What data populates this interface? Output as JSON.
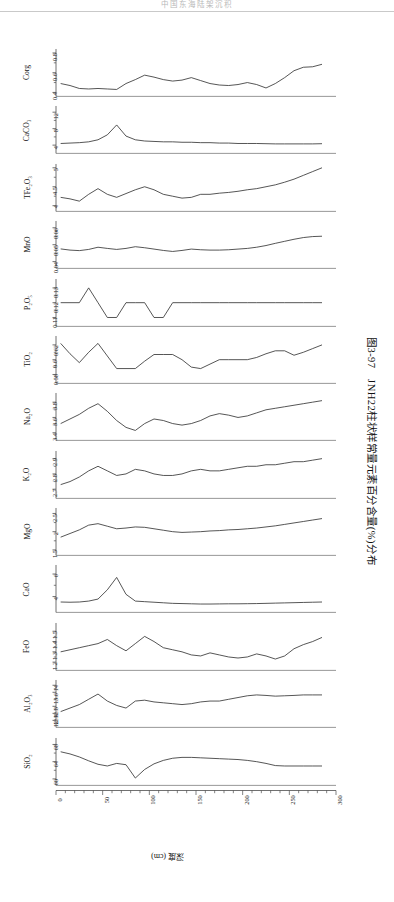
{
  "running_head": "中国东海陆架沉积",
  "figure": {
    "caption_number": "图3-97",
    "caption_text": "JNH22柱状样常量元素百分含量(%)分布",
    "caption_full": "图3-97　JNH22柱状样常量元素百分含量(%)分布",
    "x_axis": {
      "title": "深度 (cm)",
      "ticks": [
        0,
        50,
        100,
        150,
        200,
        250,
        300
      ],
      "minor_step": 10,
      "range": [
        0,
        300
      ]
    },
    "line_color": "#2b2b2b",
    "axis_color": "#4d4d4d"
  },
  "chart_data": {
    "type": "line",
    "title": "JNH22柱状样常量元素百分含量(%)分布",
    "xlabel": "深度 (cm)",
    "ylabel": "",
    "shared_x": [
      5,
      15,
      25,
      35,
      45,
      55,
      65,
      75,
      85,
      95,
      105,
      115,
      125,
      135,
      145,
      155,
      165,
      175,
      185,
      195,
      205,
      215,
      225,
      235,
      245,
      255,
      265,
      275,
      285
    ],
    "xlim": [
      0,
      300
    ],
    "grid": false,
    "legend": "none",
    "panels": [
      {
        "name": "Corg",
        "label": "Corg",
        "ticks": [
          0.4,
          0.6,
          0.8
        ],
        "ylim": [
          0.36,
          0.84
        ],
        "values": [
          0.49,
          0.47,
          0.44,
          0.435,
          0.44,
          0.435,
          0.43,
          0.49,
          0.53,
          0.575,
          0.555,
          0.53,
          0.515,
          0.525,
          0.55,
          0.52,
          0.49,
          0.475,
          0.47,
          0.48,
          0.5,
          0.48,
          0.445,
          0.49,
          0.55,
          0.62,
          0.655,
          0.66,
          0.685
        ]
      },
      {
        "name": "CaCO3",
        "label": "CaCO₃",
        "ticks": [
          4,
          8,
          12
        ],
        "ylim": [
          2.0,
          13.5
        ],
        "values": [
          4.4,
          4.5,
          4.6,
          4.8,
          5.3,
          6.5,
          8.9,
          6.2,
          5.3,
          5.0,
          4.9,
          4.8,
          4.8,
          4.7,
          4.7,
          4.6,
          4.6,
          4.5,
          4.5,
          4.4,
          4.4,
          4.4,
          4.35,
          4.3,
          4.3,
          4.3,
          4.3,
          4.3,
          4.35
        ]
      },
      {
        "name": "TFe2O3",
        "label": "TFe₂O₃",
        "ticks": [
          4.0,
          4.5,
          5.0
        ],
        "ylim": [
          3.85,
          5.1
        ],
        "values": [
          4.22,
          4.18,
          4.12,
          4.3,
          4.45,
          4.3,
          4.22,
          4.32,
          4.42,
          4.5,
          4.42,
          4.3,
          4.25,
          4.2,
          4.22,
          4.3,
          4.3,
          4.33,
          4.35,
          4.38,
          4.42,
          4.45,
          4.5,
          4.55,
          4.62,
          4.7,
          4.8,
          4.9,
          5.0
        ]
      },
      {
        "name": "MnO",
        "label": "MnO",
        "ticks": [
          0.04,
          0.05,
          0.06
        ],
        "ylim": [
          0.036,
          0.064
        ],
        "values": [
          0.0475,
          0.0468,
          0.0465,
          0.0472,
          0.0485,
          0.0478,
          0.0472,
          0.0478,
          0.0488,
          0.0482,
          0.0474,
          0.0466,
          0.046,
          0.0466,
          0.0474,
          0.047,
          0.0468,
          0.0468,
          0.047,
          0.0474,
          0.0478,
          0.0485,
          0.0495,
          0.0508,
          0.052,
          0.0532,
          0.0542,
          0.0548,
          0.055
        ]
      },
      {
        "name": "P2O5",
        "label": "P₂O₅",
        "ticks": [
          0.11,
          0.12,
          0.13
        ],
        "ylim": [
          0.104,
          0.136
        ],
        "values": [
          0.12,
          0.12,
          0.12,
          0.13,
          0.12,
          0.11,
          0.11,
          0.12,
          0.12,
          0.12,
          0.11,
          0.11,
          0.12,
          0.12,
          0.12,
          0.12,
          0.12,
          0.12,
          0.12,
          0.12,
          0.12,
          0.12,
          0.12,
          0.12,
          0.12,
          0.12,
          0.12,
          0.12,
          0.12
        ]
      },
      {
        "name": "TiO2",
        "label": "TiO₂",
        "ticks": [
          0.58,
          0.6,
          0.62
        ],
        "ylim": [
          0.568,
          0.632
        ],
        "values": [
          0.622,
          0.608,
          0.596,
          0.61,
          0.622,
          0.605,
          0.588,
          0.588,
          0.588,
          0.598,
          0.607,
          0.607,
          0.607,
          0.6,
          0.59,
          0.588,
          0.594,
          0.6,
          0.6,
          0.6,
          0.6,
          0.603,
          0.608,
          0.612,
          0.612,
          0.606,
          0.61,
          0.615,
          0.62
        ]
      },
      {
        "name": "Na2O",
        "label": "Na₂O",
        "ticks": [
          3.4,
          3.6,
          3.8
        ],
        "ylim": [
          3.3,
          3.92
        ],
        "values": [
          3.52,
          3.58,
          3.64,
          3.72,
          3.78,
          3.68,
          3.56,
          3.47,
          3.43,
          3.52,
          3.58,
          3.56,
          3.52,
          3.5,
          3.52,
          3.56,
          3.62,
          3.65,
          3.63,
          3.6,
          3.62,
          3.66,
          3.7,
          3.72,
          3.74,
          3.76,
          3.78,
          3.8,
          3.82
        ]
      },
      {
        "name": "K2O",
        "label": "K₂O",
        "ticks": [
          2.7,
          2.8,
          2.9
        ],
        "ylim": [
          2.64,
          2.95
        ],
        "values": [
          2.73,
          2.75,
          2.78,
          2.82,
          2.85,
          2.82,
          2.79,
          2.8,
          2.83,
          2.82,
          2.8,
          2.79,
          2.79,
          2.8,
          2.82,
          2.83,
          2.82,
          2.82,
          2.83,
          2.84,
          2.85,
          2.85,
          2.86,
          2.86,
          2.87,
          2.88,
          2.88,
          2.89,
          2.9
        ]
      },
      {
        "name": "MgO",
        "label": "MgO",
        "ticks": [
          1.5,
          2.0,
          2.5
        ],
        "ylim": [
          1.35,
          2.65
        ],
        "values": [
          1.85,
          1.95,
          2.05,
          2.18,
          2.22,
          2.15,
          2.08,
          2.1,
          2.13,
          2.12,
          2.08,
          2.04,
          2.0,
          1.98,
          1.99,
          2.0,
          2.02,
          2.03,
          2.05,
          2.06,
          2.08,
          2.1,
          2.13,
          2.16,
          2.2,
          2.24,
          2.28,
          2.32,
          2.36
        ]
      },
      {
        "name": "CaO",
        "label": "CaO",
        "ticks": [
          4,
          6
        ],
        "ylim": [
          2.6,
          6.8
        ],
        "values": [
          3.52,
          3.5,
          3.52,
          3.6,
          3.78,
          4.6,
          5.7,
          4.2,
          3.6,
          3.55,
          3.5,
          3.45,
          3.4,
          3.38,
          3.36,
          3.34,
          3.34,
          3.35,
          3.36,
          3.36,
          3.37,
          3.38,
          3.4,
          3.42,
          3.44,
          3.46,
          3.48,
          3.5,
          3.52
        ]
      },
      {
        "name": "FeO",
        "label": "FeO",
        "ticks": [
          1.2,
          1.3,
          1.4,
          1.5
        ],
        "ylim": [
          1.12,
          1.58
        ],
        "values": [
          1.3,
          1.32,
          1.34,
          1.36,
          1.38,
          1.42,
          1.36,
          1.31,
          1.38,
          1.45,
          1.4,
          1.34,
          1.32,
          1.3,
          1.27,
          1.26,
          1.29,
          1.27,
          1.25,
          1.24,
          1.25,
          1.28,
          1.26,
          1.23,
          1.26,
          1.33,
          1.37,
          1.4,
          1.44
        ]
      },
      {
        "name": "Al2O3",
        "label": "Al₂O₃",
        "ticks": [
          12,
          12.4,
          12.8,
          13.6,
          14
        ],
        "ylim": [
          11.6,
          14.3
        ],
        "values": [
          12.5,
          12.7,
          12.9,
          13.2,
          13.5,
          13.1,
          12.85,
          12.7,
          13.1,
          13.15,
          13.05,
          13.0,
          12.95,
          12.9,
          12.95,
          13.05,
          13.1,
          13.1,
          13.2,
          13.3,
          13.4,
          13.45,
          13.42,
          13.38,
          13.4,
          13.42,
          13.45,
          13.45,
          13.45
        ]
      },
      {
        "name": "SiO2",
        "label": "SiO₂",
        "ticks": [
          60,
          64,
          68
        ],
        "ylim": [
          58.5,
          69.5
        ],
        "values": [
          66.3,
          65.8,
          65.1,
          64.2,
          63.4,
          63.0,
          63.6,
          63.3,
          60.2,
          62.2,
          63.5,
          64.3,
          64.8,
          65.0,
          65.0,
          64.9,
          64.8,
          64.7,
          64.6,
          64.5,
          64.3,
          64.0,
          63.6,
          63.1,
          63.0,
          63.0,
          63.0,
          63.0,
          63.0
        ]
      }
    ]
  }
}
